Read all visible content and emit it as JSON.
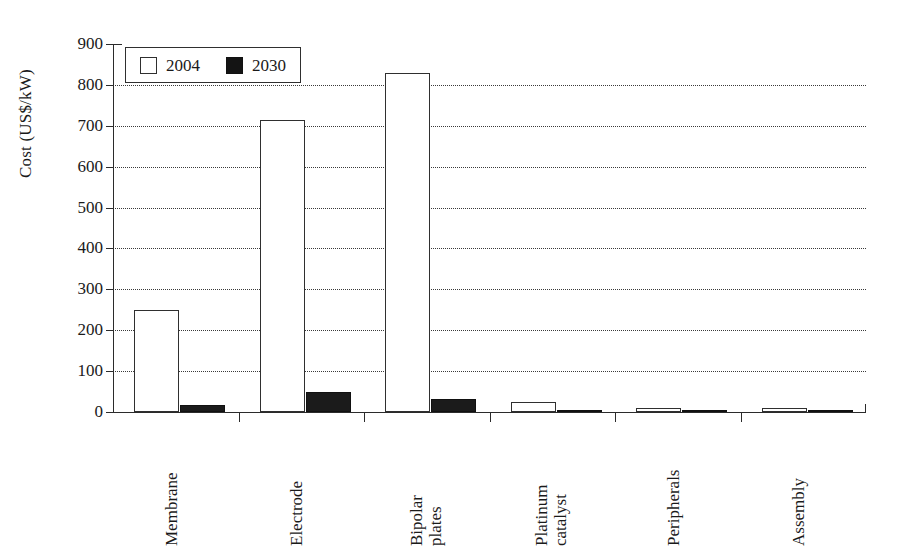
{
  "chart_data": {
    "type": "bar",
    "title": "",
    "xlabel": "",
    "ylabel": "Cost (US$/kW)",
    "ylim": [
      0,
      900
    ],
    "ytick_labels": [
      "900",
      "800",
      "700",
      "600",
      "500",
      "400",
      "300",
      "200",
      "100",
      "0"
    ],
    "ytick_values": [
      900,
      800,
      700,
      600,
      500,
      400,
      300,
      200,
      100,
      0
    ],
    "grid": "horizontal-dotted",
    "legend_position": "top-left-inside",
    "categories": [
      "Membrane",
      "Electrode",
      "Bipolar plates",
      "Platinum catalyst",
      "Peripherals",
      "Assembly"
    ],
    "category_label_lines": [
      [
        "Membrane",
        ""
      ],
      [
        "Electrode",
        ""
      ],
      [
        "Bipolar",
        "plates"
      ],
      [
        "Platinum",
        "catalyst"
      ],
      [
        "Peripherals",
        ""
      ],
      [
        "Assembly",
        ""
      ]
    ],
    "series": [
      {
        "name": "2004",
        "style": "open",
        "color": "#ffffff",
        "edge": "#2f2f2f",
        "values": [
          250,
          715,
          828,
          25,
          10,
          10
        ]
      },
      {
        "name": "2030",
        "style": "filled",
        "color": "#1b1b1b",
        "edge": "#111111",
        "values": [
          18,
          50,
          32,
          4,
          2,
          2
        ]
      }
    ]
  },
  "legend": {
    "entries": [
      {
        "label": "2004",
        "swatch": "open-square-swatch"
      },
      {
        "label": "2030",
        "swatch": "filled-square-swatch"
      }
    ]
  },
  "axes": {
    "y_title": "Cost (US$/kW)"
  }
}
